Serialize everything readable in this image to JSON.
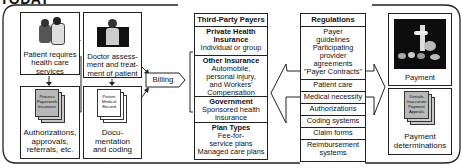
{
  "title": "TODAY",
  "provider_side": {
    "patient_box": {
      "label": "Patient requires health care services",
      "icon": "patient-doctor-illustration"
    },
    "doctor_box": {
      "label": "Doctor assess-ment and treat-ment of patient",
      "label_lines": [
        "Doctor assess-",
        "ment and treat-",
        "ment of patient"
      ],
      "icon": "doctor-illustration"
    },
    "paperwork_box": {
      "doc_label_lines": [
        "Process",
        "Paperwork",
        "Insurance"
      ],
      "label_lines": [
        "Authorizations,",
        "approvals,",
        "referrals, etc."
      ],
      "icon": "document-stack-icon"
    },
    "record_box": {
      "doc_label_lines": [
        "Patient",
        "Medical",
        "Record"
      ],
      "label_lines": [
        "Docu-",
        "mentation",
        "and coding"
      ],
      "icon": "document-stack-icon"
    },
    "patient_label_lines": [
      "Patient requires",
      "health care",
      "services"
    ]
  },
  "billing": {
    "label": "Billing"
  },
  "payers": {
    "header": "Third-Party Payers",
    "items": [
      {
        "title": "Private Health Insurance",
        "title_lines": [
          "Private Health",
          "Insurance"
        ],
        "body_lines": [
          "Individual or group"
        ]
      },
      {
        "title": "Other Insurance",
        "title_lines": [
          "Other Insurance"
        ],
        "body_lines": [
          "Automobile,",
          "personal injury,",
          "and Workers'",
          "Compensation"
        ]
      },
      {
        "title": "Government",
        "title_lines": [
          "Government"
        ],
        "body_lines": [
          "Sponsored health",
          "insurance"
        ]
      },
      {
        "title": "Plan Types",
        "title_lines": [
          "Plan Types"
        ],
        "body_lines": [
          "Fee-for-",
          "service plans",
          "Managed care plans"
        ]
      }
    ]
  },
  "regulations": {
    "header": "Regulations",
    "items": [
      {
        "lines": [
          "Payer",
          "guidelines",
          "Participating",
          "provider",
          "agreements",
          "\"Payer Contracts\""
        ]
      },
      {
        "lines": [
          "Patient care"
        ]
      },
      {
        "lines": [
          "Medical necessity"
        ]
      },
      {
        "lines": [
          "Authorizations"
        ]
      },
      {
        "lines": [
          "Coding systems"
        ]
      },
      {
        "lines": [
          "Claim forms"
        ]
      },
      {
        "lines": [
          "Reimbursement",
          "systems"
        ]
      }
    ]
  },
  "payment_side": {
    "payment_box": {
      "label": "Payment",
      "icon": "payment-photo"
    },
    "determinations_box": {
      "doc_label_lines": [
        "Denials",
        "Inaccurate",
        "Payment",
        "Appeals"
      ],
      "label_lines": [
        "Payment",
        "determinations"
      ],
      "icon": "document-stack-icon"
    }
  },
  "colors": {
    "line": "#222222",
    "doc_fill": "#e0e0e0",
    "gray_doc": "#bdbdbd",
    "photo": "#111111"
  }
}
